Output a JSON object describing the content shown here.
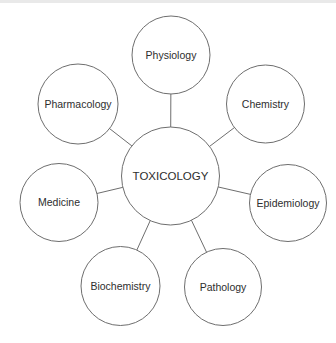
{
  "figure": {
    "type": "concept-map",
    "center": {
      "id": "toxicology",
      "label": "TOXICOLOGY",
      "x": 170.5,
      "y": 176,
      "r": 49
    },
    "nodes": [
      {
        "id": "physiology",
        "label": "Physiology",
        "x": 171,
        "y": 55,
        "r": 39
      },
      {
        "id": "chemistry",
        "label": "Chemistry",
        "x": 265.5,
        "y": 104,
        "r": 39
      },
      {
        "id": "epidemiology",
        "label": "Epidemiology",
        "x": 288,
        "y": 203,
        "r": 38.5
      },
      {
        "id": "pathology",
        "label": "Pathology",
        "x": 223,
        "y": 287,
        "r": 38.5
      },
      {
        "id": "biochemistry",
        "label": "Biochemistry",
        "x": 120.5,
        "y": 286,
        "r": 39.5
      },
      {
        "id": "medicine",
        "label": "Medicine",
        "x": 59,
        "y": 202.5,
        "r": 39
      },
      {
        "id": "pharmacology",
        "label": "Pharmacology",
        "x": 78,
        "y": 104,
        "r": 40
      }
    ],
    "style": {
      "background_color": "#ffffff",
      "circle_fill": "#ffffff",
      "circle_stroke": "#6e6e6e",
      "line_stroke": "#6e6e6e",
      "stroke_width": 1,
      "text_color": "#2e2e2e",
      "center_font_size": 11.5,
      "node_font_size": 10.5,
      "top_rule_color": "#e9e9e9"
    },
    "canvas": {
      "width": 336,
      "height": 343
    }
  }
}
